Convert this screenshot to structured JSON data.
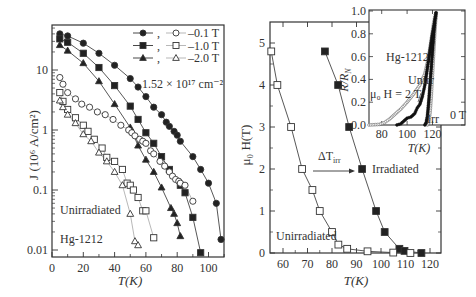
{
  "chart_data": [
    {
      "type": "scatter",
      "panel": "left",
      "title": "",
      "xlabel": "T(K)",
      "ylabel": "J (10^6 A/cm^2)",
      "xlim": [
        0,
        110
      ],
      "ylim": [
        0.008,
        60
      ],
      "yscale": "log",
      "xticks": [
        "0",
        "20",
        "40",
        "60",
        "80",
        "100"
      ],
      "yticks": [
        "0.01",
        "0.1",
        "1",
        "10"
      ],
      "annotations": [
        "1.52 × 10^17 cm^-2",
        "Unirradiated",
        "Hg-1212"
      ],
      "legend": [
        {
          "filled": "circle",
          "open": "circle",
          "label": "–0.1 T"
        },
        {
          "filled": "square",
          "open": "square",
          "label": "–1.0 T"
        },
        {
          "filled": "triangle",
          "open": "triangle",
          "label": "–2.0 T"
        }
      ],
      "series": [
        {
          "name": "Irradiated 0.1 T",
          "marker": "circle",
          "filled": true,
          "line": true,
          "x": [
            5,
            10,
            20,
            30,
            40,
            50,
            55,
            60,
            65,
            70,
            73,
            75,
            78,
            80,
            82,
            90,
            95,
            100,
            105,
            108
          ],
          "y": [
            40,
            37,
            28,
            19,
            12,
            7.2,
            5.2,
            3.6,
            2.4,
            1.8,
            1.35,
            1.15,
            0.95,
            0.82,
            0.65,
            0.36,
            0.22,
            0.13,
            0.06,
            0.015
          ]
        },
        {
          "name": "Irradiated 1.0 T",
          "marker": "square",
          "filled": true,
          "line": true,
          "x": [
            5,
            10,
            20,
            30,
            40,
            50,
            55,
            60,
            65,
            70,
            75,
            82,
            85,
            90,
            95
          ],
          "y": [
            33,
            29,
            19,
            11,
            5.5,
            2.5,
            1.5,
            0.9,
            0.6,
            0.36,
            0.22,
            0.12,
            0.09,
            0.035,
            0.009
          ]
        },
        {
          "name": "Irradiated 2.0 T",
          "marker": "triangle",
          "filled": true,
          "line": true,
          "x": [
            5,
            10,
            20,
            30,
            40,
            50,
            55,
            60,
            65,
            70,
            76,
            78,
            80,
            82
          ],
          "y": [
            26,
            21,
            13,
            6.5,
            2.7,
            1.1,
            0.55,
            0.32,
            0.2,
            0.11,
            0.05,
            0.04,
            0.028,
            0.017
          ]
        },
        {
          "name": "Unirradiated 0.1 T",
          "marker": "circle",
          "filled": false,
          "line": true,
          "x": [
            5,
            7,
            10,
            15,
            19,
            24,
            29,
            34,
            39,
            44,
            49,
            51,
            53,
            56,
            58,
            60,
            63,
            65,
            69,
            72,
            75,
            77,
            79,
            81,
            82,
            85,
            90
          ],
          "y": [
            7.5,
            5.8,
            4.2,
            3.3,
            2.7,
            2.4,
            2.0,
            1.8,
            1.5,
            1.2,
            1.0,
            0.9,
            0.8,
            0.7,
            0.65,
            0.6,
            0.45,
            0.4,
            0.3,
            0.25,
            0.2,
            0.17,
            0.15,
            0.14,
            0.13,
            0.12,
            0.065
          ]
        },
        {
          "name": "Unirradiated 1.0 T",
          "marker": "square",
          "filled": false,
          "line": true,
          "x": [
            5,
            7,
            10,
            15,
            20,
            23,
            27,
            32,
            35,
            40,
            45,
            48,
            50,
            52,
            55,
            58,
            60,
            65
          ],
          "y": [
            4.2,
            3.0,
            2.2,
            1.6,
            1.2,
            0.95,
            0.7,
            0.5,
            0.35,
            0.3,
            0.22,
            0.13,
            0.12,
            0.1,
            0.075,
            0.045,
            0.045,
            0.016
          ]
        },
        {
          "name": "Unirradiated 2.0 T",
          "marker": "triangle",
          "filled": false,
          "line": true,
          "x": [
            5,
            7,
            10,
            15,
            20,
            25,
            30,
            35,
            40,
            45,
            50,
            53,
            55
          ],
          "y": [
            3.1,
            2.4,
            1.8,
            1.3,
            0.85,
            0.65,
            0.42,
            0.3,
            0.2,
            0.12,
            0.04,
            0.014,
            0.012
          ]
        }
      ]
    },
    {
      "type": "line",
      "panel": "right",
      "title": "",
      "xlabel": "T(K)",
      "ylabel": "μ0 H(T)",
      "xlim": [
        55,
        124
      ],
      "ylim": [
        0,
        5.5
      ],
      "xticks": [
        "60",
        "70",
        "80",
        "90",
        "100",
        "110",
        "120"
      ],
      "yticks": [
        "0",
        "1",
        "2",
        "3",
        "4",
        "5"
      ],
      "annotations": [
        "ΔT_irr",
        "Irradiated",
        "Unirradiated"
      ],
      "series": [
        {
          "name": "Irradiated",
          "marker": "square",
          "filled": true,
          "x": [
            77.1,
            82.5,
            87.0,
            92.3,
            98.0,
            101.5,
            107.5,
            109.6,
            116.5
          ],
          "y": [
            4.8,
            4.0,
            3.0,
            2.0,
            1.0,
            0.5,
            0.1,
            0.05,
            0.0
          ]
        },
        {
          "name": "Unirradiated",
          "marker": "square",
          "filled": false,
          "x": [
            55.2,
            57.7,
            63.3,
            67.8,
            72.0,
            75.0,
            80.0,
            82.6,
            86.2,
            94.5,
            105.0,
            112.0
          ],
          "y": [
            4.8,
            4.0,
            3.0,
            2.0,
            1.5,
            1.0,
            0.5,
            0.2,
            0.1,
            0.04,
            0.01,
            0.0
          ]
        }
      ]
    },
    {
      "type": "line",
      "panel": "inset",
      "title": "",
      "xlabel": "T(K)",
      "ylabel": "R/R_N",
      "xlim": [
        70,
        125
      ],
      "ylim": [
        0,
        1.0
      ],
      "xticks": [
        "80",
        "100",
        "120"
      ],
      "yticks": [
        "0.0",
        "0.2",
        "0.4",
        "0.6",
        "0.8",
        "1.0"
      ],
      "annotations": [
        "Hg-1212",
        "Unirr",
        "μ0 H = 2 T",
        "Irr",
        "0 T"
      ],
      "series": [
        {
          "name": "Unirr 2 T",
          "marker": "circle",
          "filled": false,
          "x": [
            70,
            78,
            82,
            86,
            90,
            95,
            100,
            105,
            110,
            114,
            117,
            119,
            121,
            123
          ],
          "y": [
            0,
            0.005,
            0.02,
            0.05,
            0.09,
            0.14,
            0.2,
            0.27,
            0.35,
            0.45,
            0.6,
            0.75,
            0.9,
            1.0
          ]
        },
        {
          "name": "Irr 2 T",
          "marker": "circle",
          "filled": true,
          "x": [
            92,
            95,
            98,
            100,
            103,
            106,
            108,
            110,
            112,
            114,
            116,
            118,
            120,
            122,
            123
          ],
          "y": [
            0,
            0.01,
            0.04,
            0.06,
            0.07,
            0.1,
            0.15,
            0.18,
            0.25,
            0.35,
            0.5,
            0.65,
            0.8,
            0.92,
            1.0
          ]
        },
        {
          "name": "Unirr 0 T",
          "marker": "circle",
          "filled": false,
          "x": [
            116,
            117,
            118,
            119,
            120,
            121,
            122,
            123
          ],
          "y": [
            0,
            0.02,
            0.1,
            0.25,
            0.45,
            0.65,
            0.85,
            1.0
          ]
        },
        {
          "name": "Irr 0 T",
          "marker": "circle",
          "filled": true,
          "x": [
            114,
            115,
            116,
            117,
            118,
            119,
            120,
            121,
            122,
            123
          ],
          "y": [
            0,
            0.02,
            0.08,
            0.2,
            0.35,
            0.5,
            0.65,
            0.8,
            0.92,
            1.0
          ]
        }
      ]
    }
  ],
  "text": {
    "left_ylabel": "J (10⁶ A/cm²)",
    "left_xlabel": "T(K)",
    "left_fluence": "1.52 × 10¹⁷ cm⁻²",
    "left_unirr": "Unirradiated",
    "left_material": "Hg-1212",
    "legend": [
      "–0.1 T",
      "–1.0 T",
      "–2.0 T"
    ],
    "right_ylabel": "μ₀ H(T)",
    "right_xlabel": "T(K)",
    "right_irr": "Irradiated",
    "right_unirr": "Unirradiated",
    "right_delta": "ΔT",
    "right_delta_sub": "irr",
    "inset_ylabel": "R/R",
    "inset_ylabel_sub": "N",
    "inset_xlabel": "T(K)",
    "inset_material": "Hg-1212",
    "inset_unirr": "Unirr",
    "inset_field": "μ₀ H = 2 T",
    "inset_irr": "Irr",
    "inset_zero": "0 T"
  }
}
